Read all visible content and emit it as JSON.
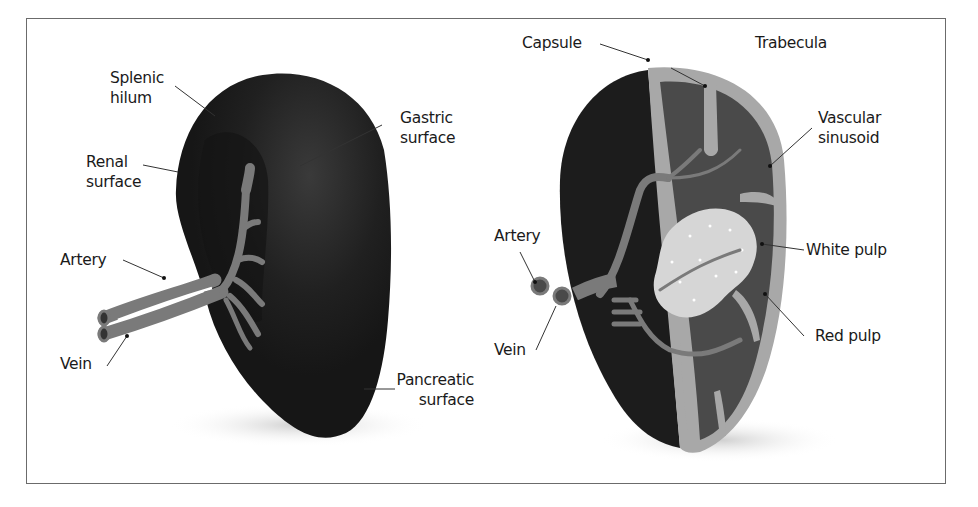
{
  "diagram": {
    "panels": [
      {
        "id": "external-view",
        "labels": {
          "splenic_hilum": "Splenic\nhilum",
          "gastric_surface": "Gastric\nsurface",
          "renal_surface": "Renal\nsurface",
          "artery": "Artery",
          "vein": "Vein",
          "pancreatic_surface": "Pancreatic\nsurface"
        }
      },
      {
        "id": "cross-section-view",
        "labels": {
          "capsule": "Capsule",
          "trabecula": "Trabecula",
          "vascular_sinusoid": "Vascular\nsinusoid",
          "artery": "Artery",
          "white_pulp": "White pulp",
          "vein": "Vein",
          "red_pulp": "Red pulp"
        }
      }
    ],
    "colors": {
      "organ_dark": "#1c1c1c",
      "vessel_gray": "#7a7a7a",
      "capsule_gray": "#a8a8a8",
      "red_pulp": "#4a4a4a",
      "white_pulp": "#d6d6d6",
      "frame_border": "#6b6b6b",
      "leader_line": "#333333"
    }
  }
}
